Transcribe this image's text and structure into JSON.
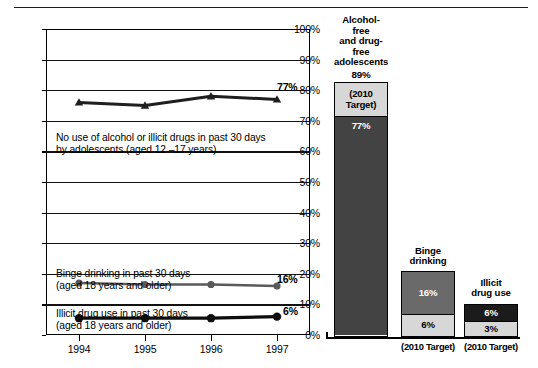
{
  "chart_data": [
    {
      "type": "line",
      "title": "",
      "xlabel": "",
      "ylabel": "",
      "x": [
        "1994",
        "1995",
        "1996",
        "1997"
      ],
      "ylim": [
        0,
        100
      ],
      "ytick_labels": [
        "0%",
        "10%",
        "20%",
        "30%",
        "40%",
        "50%",
        "60%",
        "70%",
        "80%",
        "90%",
        "100%"
      ],
      "ytick_values": [
        0,
        10,
        20,
        30,
        40,
        50,
        60,
        70,
        80,
        90,
        100
      ],
      "grid": true,
      "legend": "inline annotations",
      "series": [
        {
          "name": "No use of alcohol or illicit drugs in past 30 days by adolescents (aged 12 –17 years)",
          "marker": "triangle",
          "values": [
            76,
            75,
            78,
            77
          ],
          "end_label": "77%"
        },
        {
          "name": "Binge drinking in past 30 days (aged 18 years and older)",
          "marker": "circle-gray",
          "values": [
            17,
            16.5,
            16.5,
            16
          ],
          "end_label": "16%"
        },
        {
          "name": "Illicit drug use in past 30 days (aged 18 years and older)",
          "marker": "circle-black",
          "values": [
            5.5,
            5.5,
            5.5,
            6
          ],
          "end_label": "6%"
        }
      ],
      "annotations": [
        {
          "text": "No use of alcohol or illicit drugs in past 30 days\nby adolescents (aged 12 –17 years)",
          "at": 72
        },
        {
          "text": "Binge drinking in past 30 days\n(aged 18 years and older)",
          "at": 22
        },
        {
          "text": "Illicit drug use in past 30 days\n(aged 18 years and older)",
          "at": 11
        }
      ]
    },
    {
      "type": "bar",
      "title": "",
      "stacked": true,
      "ylim": [
        0,
        100
      ],
      "categories": [
        "Alcohol-free and drug-free adolescents",
        "Binge drinking",
        "Illicit drug use"
      ],
      "bars": [
        {
          "label": "Alcohol-free\nand drug-free\nadolescents",
          "top_value": "89%",
          "target": 89,
          "current": 77,
          "current_label": "77%",
          "target_label": "(2010\nTarget)",
          "footnote": "",
          "current_shade": "dark"
        },
        {
          "label": "Binge\ndrinking",
          "top_value": "",
          "target": 6,
          "current": 16,
          "current_label": "16%",
          "target_label": "6%",
          "footnote": "(2010 Target)",
          "current_shade": "mid"
        },
        {
          "label": "Illicit\ndrug use",
          "top_value": "",
          "target": 3,
          "current": 6,
          "current_label": "6%",
          "target_label": "3%",
          "footnote": "(2010 Target)",
          "current_shade": "darker"
        }
      ]
    }
  ],
  "line_chart": {
    "y_labels": [
      "100%",
      "90%",
      "80%",
      "70%",
      "60%",
      "50%",
      "40%",
      "30%",
      "20%",
      "10%",
      "0%"
    ],
    "x_labels": [
      "1994",
      "1995",
      "1996",
      "1997"
    ],
    "annotation_1": "No use of alcohol or illicit drugs in past 30 days\nby adolescents (aged 12 –17 years)",
    "annotation_2": "Binge drinking in past 30 days\n(aged 18 years and older)",
    "annotation_3": "Illicit drug use in past 30 days\n(aged 18 years and older)",
    "value_1": "77%",
    "value_2": "16%",
    "value_3": "6%"
  },
  "bar_chart": {
    "bar1_title": "Alcohol-free\nand drug-free\nadolescents",
    "bar1_top": "89%",
    "bar1_target": "(2010\nTarget)",
    "bar1_current": "77%",
    "bar2_title": "Binge\ndrinking",
    "bar2_current": "16%",
    "bar2_target": "6%",
    "bar2_foot": "(2010 Target)",
    "bar3_title": "Illicit\ndrug use",
    "bar3_current": "6%",
    "bar3_target": "3%",
    "bar3_foot": "(2010 Target)"
  },
  "colors": {
    "axis": "#000000",
    "light_gray": "#d7d7d7",
    "mid_gray": "#6a6a6a",
    "dark_gray": "#434343",
    "near_black": "#1b1b1b"
  }
}
